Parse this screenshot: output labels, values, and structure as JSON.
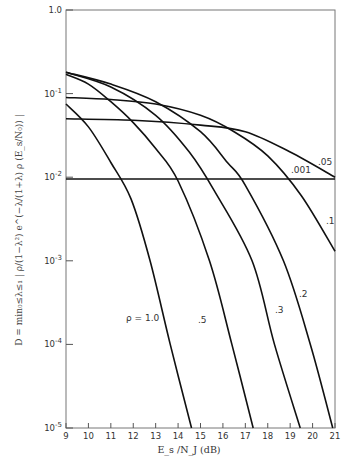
{
  "chart_data": {
    "type": "line",
    "title": "",
    "xlabel": "E_s / N_J (dB)",
    "ylabel": "D = min over 0≤λ≤1 of | ρ/(1−λ²) · e^(−λ/(1+λ) · ρ · (E_s/N_0)) |",
    "xlim": [
      9,
      21
    ],
    "ylim": [
      1e-05,
      1.0
    ],
    "yscale": "log",
    "grid": false,
    "legend": "inline curve labels",
    "x_ticks": [
      "9",
      "10",
      "11",
      "12",
      "13",
      "14",
      "15",
      "16",
      "17",
      "18",
      "19",
      "20",
      "21"
    ],
    "y_ticks": [
      "1.0",
      "10^-1",
      "10^-2",
      "10^-3",
      "10^-4",
      "10^-5"
    ],
    "series": [
      {
        "name": "ρ = 1.0",
        "label": "ρ = 1.0",
        "points": [
          [
            9,
            0.075
          ],
          [
            10,
            0.04
          ],
          [
            11,
            0.015
          ],
          [
            11.9,
            0.0055
          ],
          [
            12.75,
            0.001
          ],
          [
            13.65,
            0.0001
          ],
          [
            14.6,
            1e-05
          ]
        ]
      },
      {
        "name": "ρ = .5",
        "label": ".5",
        "points": [
          [
            9,
            0.17
          ],
          [
            10,
            0.13
          ],
          [
            11,
            0.08
          ],
          [
            12,
            0.045
          ],
          [
            13,
            0.022
          ],
          [
            14,
            0.009
          ],
          [
            15.4,
            0.001
          ],
          [
            16.4,
            0.0001
          ],
          [
            17.35,
            1e-05
          ]
        ]
      },
      {
        "name": "ρ = .3",
        "label": ".3",
        "points": [
          [
            9,
            0.18
          ],
          [
            11,
            0.12
          ],
          [
            13,
            0.055
          ],
          [
            14.5,
            0.02
          ],
          [
            15.6,
            0.007
          ],
          [
            17.3,
            0.001
          ],
          [
            18.3,
            0.0001
          ],
          [
            19.45,
            1e-05
          ]
        ]
      },
      {
        "name": "ρ = .2",
        "label": ".2",
        "points": [
          [
            9,
            0.18
          ],
          [
            11,
            0.13
          ],
          [
            13,
            0.08
          ],
          [
            15,
            0.035
          ],
          [
            16.2,
            0.015
          ],
          [
            17,
            0.008
          ],
          [
            18.7,
            0.001
          ],
          [
            19.9,
            0.0001
          ],
          [
            20.9,
            1e-05
          ]
        ]
      },
      {
        "name": "ρ = .1",
        "label": ".1",
        "points": [
          [
            9,
            0.09
          ],
          [
            11,
            0.085
          ],
          [
            13,
            0.075
          ],
          [
            15,
            0.055
          ],
          [
            16.5,
            0.035
          ],
          [
            18,
            0.018
          ],
          [
            19.5,
            0.006
          ],
          [
            21,
            0.0013
          ]
        ]
      },
      {
        "name": "ρ = .05",
        "label": ".05",
        "points": [
          [
            9,
            0.05
          ],
          [
            12,
            0.048
          ],
          [
            15,
            0.042
          ],
          [
            17,
            0.035
          ],
          [
            19,
            0.02
          ],
          [
            21,
            0.01
          ]
        ]
      },
      {
        "name": "ρ = .001",
        "label": ".001",
        "points": [
          [
            9,
            0.0095
          ],
          [
            21,
            0.0095
          ]
        ]
      }
    ]
  },
  "labels": {
    "xlabel": "E_s /N_J  (dB)",
    "ylabel": "D = min₀≤λ≤₁ | ρ/(1−λ²) e^(−λ/(1+λ) ρ (E_s/N₀)) |"
  }
}
